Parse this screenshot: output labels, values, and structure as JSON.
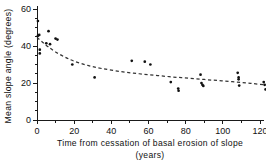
{
  "chart_data": {
    "type": "scatter",
    "title": "",
    "subtitle": "",
    "xlabel": "Time from cessation of basal erosion of slope",
    "xlabel_units": "(years)",
    "ylabel": "Mean slope angle (degrees)",
    "xlim": [
      0,
      126
    ],
    "ylim": [
      0,
      62
    ],
    "xticks": [
      0,
      20,
      40,
      60,
      80,
      100,
      120
    ],
    "xtick_labels": [
      "0",
      "20",
      "40",
      "60",
      "80",
      "100",
      "120"
    ],
    "xminor_ticks": [
      10,
      30,
      50,
      70,
      90,
      110
    ],
    "yticks": [
      0,
      20,
      40,
      60
    ],
    "ytick_labels": [
      "0",
      "20",
      "40",
      "60"
    ],
    "yminor_ticks": [
      5,
      10,
      15,
      25,
      30,
      35,
      45,
      50,
      55
    ],
    "grid": false,
    "legend": null,
    "marker_color": "#111111",
    "axis_color": "#1a1a1a",
    "curve_color": "#333333",
    "curve_style": "dashed",
    "points": [
      {
        "x": 0.5,
        "y": 53.5
      },
      {
        "x": 0.5,
        "y": 45.5
      },
      {
        "x": 1.2,
        "y": 46.0
      },
      {
        "x": 1.5,
        "y": 38.0
      },
      {
        "x": 1.5,
        "y": 36.0
      },
      {
        "x": 5.0,
        "y": 41.5
      },
      {
        "x": 6.2,
        "y": 48.0
      },
      {
        "x": 7.0,
        "y": 41.0
      },
      {
        "x": 10.0,
        "y": 44.0
      },
      {
        "x": 11.0,
        "y": 43.5
      },
      {
        "x": 19.0,
        "y": 30.0
      },
      {
        "x": 31.0,
        "y": 23.0
      },
      {
        "x": 51.0,
        "y": 32.0
      },
      {
        "x": 58.0,
        "y": 31.5
      },
      {
        "x": 61.0,
        "y": 30.0
      },
      {
        "x": 72.0,
        "y": 20.5
      },
      {
        "x": 76.0,
        "y": 17.0
      },
      {
        "x": 76.2,
        "y": 15.8
      },
      {
        "x": 88.0,
        "y": 24.5
      },
      {
        "x": 88.5,
        "y": 20.0
      },
      {
        "x": 89.0,
        "y": 19.0
      },
      {
        "x": 89.5,
        "y": 18.4
      },
      {
        "x": 108.0,
        "y": 25.5
      },
      {
        "x": 108.5,
        "y": 23.0
      },
      {
        "x": 108.5,
        "y": 22.0
      },
      {
        "x": 108.8,
        "y": 18.6
      },
      {
        "x": 122.0,
        "y": 20.5
      },
      {
        "x": 122.5,
        "y": 19.0
      },
      {
        "x": 123.0,
        "y": 16.5
      }
    ],
    "curve": [
      {
        "x": 0.0,
        "y": 44.6
      },
      {
        "x": 3.0,
        "y": 42.0
      },
      {
        "x": 6.0,
        "y": 39.6
      },
      {
        "x": 10.0,
        "y": 36.8
      },
      {
        "x": 15.0,
        "y": 34.0
      },
      {
        "x": 20.0,
        "y": 31.8
      },
      {
        "x": 27.0,
        "y": 29.6
      },
      {
        "x": 35.0,
        "y": 27.8
      },
      {
        "x": 45.0,
        "y": 26.2
      },
      {
        "x": 55.0,
        "y": 25.0
      },
      {
        "x": 65.0,
        "y": 24.0
      },
      {
        "x": 75.0,
        "y": 23.1
      },
      {
        "x": 85.0,
        "y": 22.3
      },
      {
        "x": 95.0,
        "y": 21.5
      },
      {
        "x": 105.0,
        "y": 20.7
      },
      {
        "x": 115.0,
        "y": 19.8
      },
      {
        "x": 125.0,
        "y": 18.8
      }
    ]
  }
}
